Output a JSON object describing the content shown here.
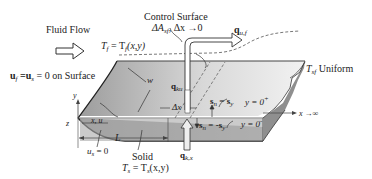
{
  "diagram": {
    "type": "heat transfer schematic: fluid flow over a semi-infinite plate",
    "labels": {
      "fluid_flow": "Fluid Flow",
      "control_surface_title": "Control Surface",
      "control_surface_sub_a": "ΔA",
      "control_surface_sub_a_index": "sf",
      "control_surface_sub_b": ", Δx →0",
      "q_u_f": "q",
      "q_u_f_index": "u,f",
      "tf_eq_a": "T",
      "tf_eq_a_index": "f",
      "tf_eq_b": " = T",
      "tf_eq_b_index": "f",
      "tf_eq_c": "(x,y)",
      "no_slip_a": "u",
      "no_slip_a_index": "f",
      "no_slip_b": " =u",
      "no_slip_b_index": "s",
      "no_slip_c": " = 0 on Surface",
      "tsf_a": "T",
      "tsf_index": "sf",
      "tsf_b": " Uniform",
      "w": "w",
      "q_ku": "q",
      "q_ku_index": "ku",
      "delta_x": "Δx",
      "sn_top_a": "s",
      "sn_top_index": "n",
      "sn_top_b": " = s",
      "sn_top_b_index": "y",
      "sn_bot_a": "s",
      "sn_bot_index": "n",
      "sn_bot_b": " = -s",
      "sn_bot_b_index": "y",
      "y_plus": "y = 0",
      "y_plus_sup": "+",
      "y_minus": "y = 0",
      "y_minus_sup": "-",
      "x_inf": "x →∞",
      "axis_y": "y",
      "axis_z": "z",
      "axis_x": "x, u",
      "L": "L",
      "us_a": "u",
      "us_index": "s",
      "us_b": " = 0",
      "solid": "Solid",
      "ts_a": "T",
      "ts_a_index": "s",
      "ts_b": " = T",
      "ts_b_index": "s",
      "ts_c": "(x,y)",
      "q_kx": "q",
      "q_kx_index": "k,x"
    },
    "colors": {
      "plate_top": "#b5b5b5",
      "plate_side": "#a8a8a8",
      "outline": "#333333",
      "arrow_fill": "#ffffff"
    }
  }
}
